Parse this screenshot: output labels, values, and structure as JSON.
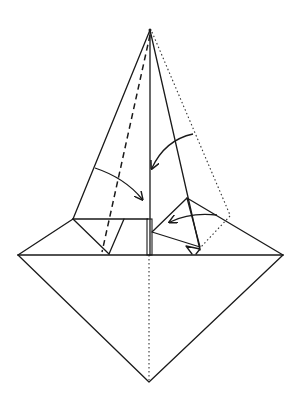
{
  "diagram": {
    "type": "origami-fold-diagram",
    "colors": {
      "line": "#1a1a1a",
      "background": "#ffffff"
    },
    "points": {
      "apex": [
        150,
        30
      ],
      "left_corner": [
        18,
        255
      ],
      "right_corner": [
        283,
        255
      ],
      "bottom": [
        149,
        382
      ]
    },
    "line_types": {
      "solid": "edge / crease",
      "dashed": "valley fold",
      "dotted": "hidden edge / fold line"
    },
    "arrows": [
      {
        "name": "left-fold-arrow",
        "meaning": "fold left flap toward center"
      },
      {
        "name": "upper-right-fold-arrow",
        "meaning": "fold right edge toward center"
      },
      {
        "name": "lower-right-fold-arrow",
        "meaning": "fold right flap toward center"
      }
    ]
  }
}
